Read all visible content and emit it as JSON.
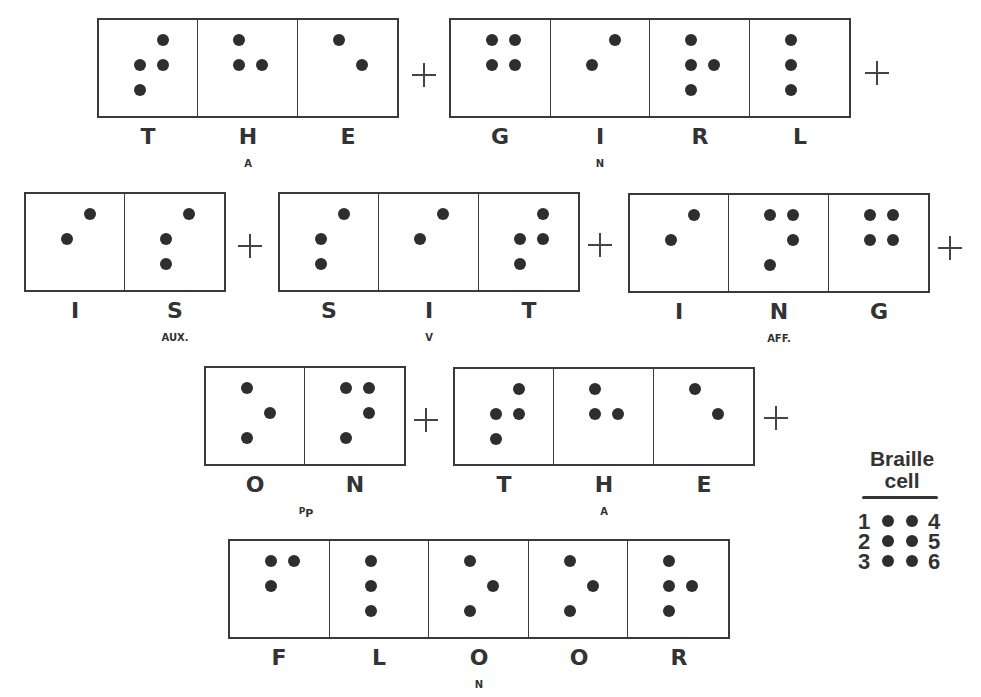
{
  "sentence_groups": [
    {
      "id": "the-1",
      "x": 97,
      "y": 18,
      "h": 100,
      "word": "THE",
      "annotation_cell": 1,
      "cells": [
        {
          "letter": "T",
          "sub": "",
          "dots": [
            2,
            3,
            4,
            5
          ]
        },
        {
          "letter": "H",
          "sub": "A",
          "dots": [
            1,
            2,
            5
          ]
        },
        {
          "letter": "E",
          "sub": "",
          "dots": [
            1,
            5
          ]
        }
      ]
    },
    {
      "id": "girl",
      "x": 449,
      "y": 18,
      "h": 100,
      "word": "GIRL",
      "cells": [
        {
          "letter": "G",
          "sub": "",
          "dots": [
            1,
            2,
            4,
            5
          ]
        },
        {
          "letter": "I",
          "sub": "N",
          "dots": [
            2,
            4
          ]
        },
        {
          "letter": "R",
          "sub": "",
          "dots": [
            1,
            2,
            3,
            5
          ]
        },
        {
          "letter": "L",
          "sub": "",
          "dots": [
            1,
            2,
            3
          ]
        }
      ]
    },
    {
      "id": "is",
      "x": 24,
      "y": 192,
      "h": 100,
      "word": "IS",
      "cells": [
        {
          "letter": "I",
          "sub": "",
          "dots": [
            2,
            4
          ]
        },
        {
          "letter": "S",
          "sub": "AUX.",
          "dots": [
            2,
            3,
            4
          ]
        }
      ]
    },
    {
      "id": "sit",
      "x": 278,
      "y": 192,
      "h": 100,
      "word": "SIT",
      "cells": [
        {
          "letter": "S",
          "sub": "",
          "dots": [
            2,
            3,
            4
          ]
        },
        {
          "letter": "I",
          "sub": "V",
          "dots": [
            2,
            4
          ]
        },
        {
          "letter": "T",
          "sub": "",
          "dots": [
            2,
            3,
            4,
            5
          ]
        }
      ]
    },
    {
      "id": "ing",
      "x": 628,
      "y": 193,
      "h": 100,
      "word": "ING",
      "cells": [
        {
          "letter": "I",
          "sub": "",
          "dots": [
            2,
            4
          ]
        },
        {
          "letter": "N",
          "sub": "AFF.",
          "dots": [
            1,
            3,
            4,
            5
          ]
        },
        {
          "letter": "G",
          "sub": "",
          "dots": [
            1,
            2,
            4,
            5
          ]
        }
      ]
    },
    {
      "id": "on",
      "x": 204,
      "y": 366,
      "h": 100,
      "word": "ON",
      "cells": [
        {
          "letter": "O",
          "sub": "",
          "dots": [
            1,
            3,
            5
          ]
        },
        {
          "letter": "N",
          "sub": "",
          "dots": [
            1,
            3,
            4,
            5
          ]
        }
      ],
      "group_sub": "PP"
    },
    {
      "id": "the-2",
      "x": 453,
      "y": 367,
      "h": 99,
      "word": "THE",
      "cells": [
        {
          "letter": "T",
          "sub": "",
          "dots": [
            2,
            3,
            4,
            5
          ]
        },
        {
          "letter": "H",
          "sub": "A",
          "dots": [
            1,
            2,
            5
          ]
        },
        {
          "letter": "E",
          "sub": "",
          "dots": [
            1,
            5
          ]
        }
      ]
    },
    {
      "id": "floor",
      "x": 228,
      "y": 539,
      "h": 100,
      "word": "FLOOR",
      "cells": [
        {
          "letter": "F",
          "sub": "",
          "dots": [
            1,
            2,
            4
          ]
        },
        {
          "letter": "L",
          "sub": "",
          "dots": [
            1,
            2,
            3
          ]
        },
        {
          "letter": "O",
          "sub": "N",
          "dots": [
            1,
            3,
            5
          ]
        },
        {
          "letter": "O",
          "sub": "",
          "dots": [
            1,
            3,
            5
          ]
        },
        {
          "letter": "R",
          "sub": "",
          "dots": [
            1,
            2,
            3,
            5
          ]
        }
      ]
    }
  ],
  "plus_signs": [
    {
      "x": 412,
      "y": 63
    },
    {
      "x": 865,
      "y": 61
    },
    {
      "x": 238,
      "y": 234
    },
    {
      "x": 588,
      "y": 233
    },
    {
      "x": 938,
      "y": 236
    },
    {
      "x": 414,
      "y": 408
    },
    {
      "x": 764,
      "y": 406
    }
  ],
  "plus_symbol": "+",
  "legend": {
    "title_line1": "Braille",
    "title_line2": "cell",
    "rows": [
      {
        "left": "1",
        "right": "4"
      },
      {
        "left": "2",
        "right": "5"
      },
      {
        "left": "3",
        "right": "6"
      }
    ]
  }
}
